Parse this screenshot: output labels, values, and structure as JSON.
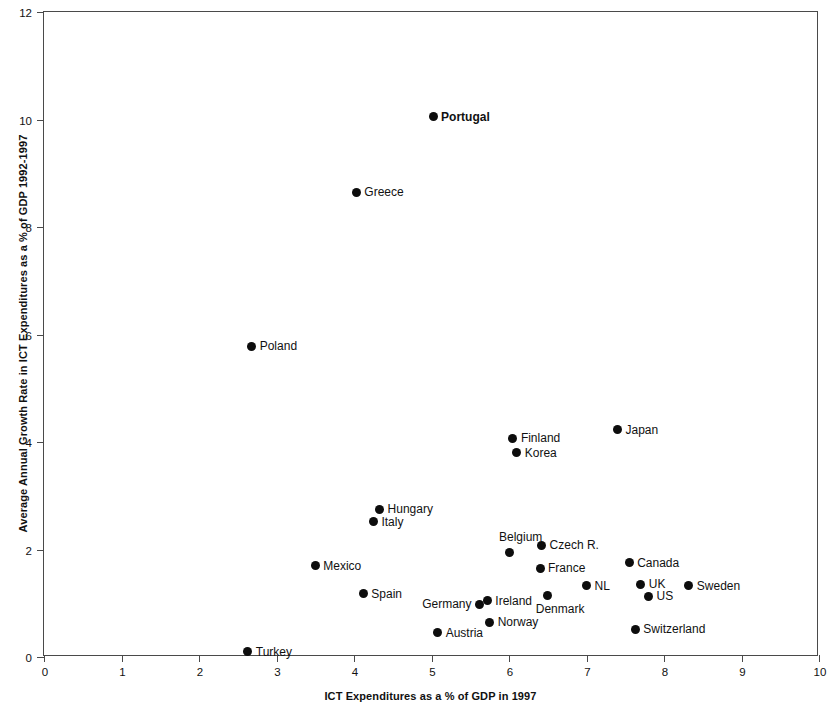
{
  "chart_data": {
    "type": "scatter",
    "title": "",
    "xlabel": "ICT Expenditures as a % of GDP in 1997",
    "ylabel": "Average Annual Growth Rate in ICT Expenditures as a % of GDP 1992-1997",
    "xlim": [
      0,
      10
    ],
    "ylim": [
      0,
      12
    ],
    "xticks": [
      "0",
      "1",
      "2",
      "3",
      "4",
      "5",
      "6",
      "7",
      "8",
      "9",
      "10"
    ],
    "yticks": [
      "0",
      "2",
      "4",
      "6",
      "8",
      "10",
      "12"
    ],
    "grid": false,
    "legend": "none",
    "marker_color": "#0d0d0d",
    "axis_color": "#4a4a4a",
    "points": [
      {
        "label": "Portugal",
        "x": 5.02,
        "y": 10.05,
        "label_pos": "right",
        "bold": true
      },
      {
        "label": "Greece",
        "x": 4.03,
        "y": 8.65,
        "label_pos": "right",
        "bold": false
      },
      {
        "label": "Poland",
        "x": 2.68,
        "y": 5.78,
        "label_pos": "right",
        "bold": false
      },
      {
        "label": "Japan",
        "x": 7.4,
        "y": 4.23,
        "label_pos": "right",
        "bold": false
      },
      {
        "label": "Finland",
        "x": 6.05,
        "y": 4.07,
        "label_pos": "right",
        "bold": false
      },
      {
        "label": "Korea",
        "x": 6.1,
        "y": 3.8,
        "label_pos": "right",
        "bold": false
      },
      {
        "label": "Hungary",
        "x": 4.33,
        "y": 2.75,
        "label_pos": "right",
        "bold": false
      },
      {
        "label": "Italy",
        "x": 4.25,
        "y": 2.52,
        "label_pos": "right",
        "bold": false
      },
      {
        "label": "Czech R.",
        "x": 6.42,
        "y": 2.08,
        "label_pos": "right",
        "bold": false
      },
      {
        "label": "Belgium",
        "x": 6.0,
        "y": 1.95,
        "label_pos": "above",
        "bold": false
      },
      {
        "label": "Canada",
        "x": 7.55,
        "y": 1.75,
        "label_pos": "right",
        "bold": false
      },
      {
        "label": "Mexico",
        "x": 3.5,
        "y": 1.7,
        "label_pos": "right",
        "bold": false
      },
      {
        "label": "France",
        "x": 6.4,
        "y": 1.65,
        "label_pos": "right",
        "bold": false
      },
      {
        "label": "NL",
        "x": 7.0,
        "y": 1.33,
        "label_pos": "right",
        "bold": false
      },
      {
        "label": "UK",
        "x": 7.7,
        "y": 1.35,
        "label_pos": "right",
        "bold": false
      },
      {
        "label": "Sweden",
        "x": 8.32,
        "y": 1.33,
        "label_pos": "right",
        "bold": false
      },
      {
        "label": "Denmark",
        "x": 6.5,
        "y": 1.15,
        "label_pos": "below",
        "bold": false
      },
      {
        "label": "Spain",
        "x": 4.12,
        "y": 1.18,
        "label_pos": "right",
        "bold": false
      },
      {
        "label": "US",
        "x": 7.8,
        "y": 1.13,
        "label_pos": "right",
        "bold": false
      },
      {
        "label": "Ireland",
        "x": 5.72,
        "y": 1.05,
        "label_pos": "right",
        "bold": false
      },
      {
        "label": "Germany",
        "x": 5.62,
        "y": 0.98,
        "label_pos": "left",
        "bold": false
      },
      {
        "label": "Norway",
        "x": 5.75,
        "y": 0.65,
        "label_pos": "right",
        "bold": false
      },
      {
        "label": "Switzerland",
        "x": 7.63,
        "y": 0.52,
        "label_pos": "right",
        "bold": false
      },
      {
        "label": "Austria",
        "x": 5.08,
        "y": 0.45,
        "label_pos": "right",
        "bold": false
      },
      {
        "label": "Turkey",
        "x": 2.63,
        "y": 0.1,
        "label_pos": "right",
        "bold": false
      }
    ]
  }
}
